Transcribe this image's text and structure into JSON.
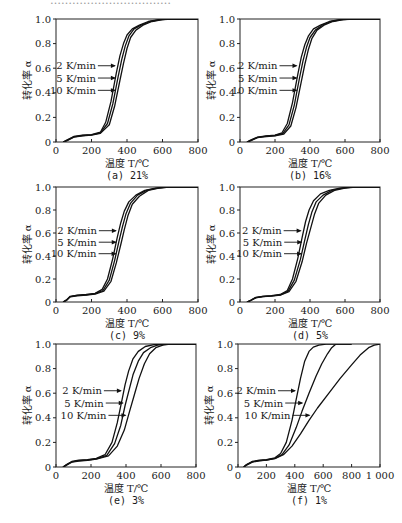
{
  "header_fragment": "……………………………",
  "chart_data": [
    {
      "id": "a",
      "type": "line",
      "caption": "(a) 21%",
      "xlabel": "温度 T/℃",
      "ylabel": "转化率 α",
      "xlim": [
        0,
        800
      ],
      "ylim": [
        0,
        1.0
      ],
      "xticks": [
        0,
        200,
        400,
        600,
        800
      ],
      "yticks": [
        0,
        0.2,
        0.4,
        0.6,
        0.8,
        1.0
      ],
      "ytick_labels": [
        "0",
        "0.2",
        "0.4",
        "0.6",
        "0.8",
        "1.0"
      ],
      "legend_arrows": [
        "2 K/min",
        "5 K/min",
        "10 K/min"
      ],
      "series": [
        {
          "name": "2 K/min",
          "x": [
            40,
            60,
            100,
            150,
            200,
            250,
            280,
            310,
            340,
            360,
            380,
            400,
            430,
            470,
            520,
            580,
            650,
            800
          ],
          "y": [
            0,
            0.015,
            0.045,
            0.055,
            0.06,
            0.08,
            0.16,
            0.33,
            0.56,
            0.7,
            0.8,
            0.87,
            0.92,
            0.95,
            0.98,
            0.995,
            1.0,
            1.0
          ]
        },
        {
          "name": "5 K/min",
          "x": [
            40,
            60,
            100,
            150,
            200,
            250,
            290,
            320,
            350,
            370,
            390,
            410,
            440,
            480,
            530,
            590,
            650,
            800
          ],
          "y": [
            0,
            0.012,
            0.042,
            0.053,
            0.058,
            0.075,
            0.15,
            0.31,
            0.53,
            0.67,
            0.78,
            0.86,
            0.92,
            0.95,
            0.98,
            0.995,
            1.0,
            1.0
          ]
        },
        {
          "name": "10 K/min",
          "x": [
            40,
            60,
            100,
            150,
            200,
            250,
            300,
            330,
            360,
            380,
            400,
            420,
            450,
            490,
            540,
            600,
            660,
            800
          ],
          "y": [
            0,
            0.01,
            0.04,
            0.05,
            0.055,
            0.07,
            0.14,
            0.29,
            0.5,
            0.64,
            0.76,
            0.85,
            0.91,
            0.95,
            0.98,
            0.995,
            1.0,
            1.0
          ]
        }
      ]
    },
    {
      "id": "b",
      "type": "line",
      "caption": "(b) 16%",
      "xlabel": "温度 T/℃",
      "ylabel": "转化率 α",
      "xlim": [
        0,
        800
      ],
      "ylim": [
        0,
        1.0
      ],
      "xticks": [
        0,
        200,
        400,
        600,
        800
      ],
      "yticks": [
        0,
        0.2,
        0.4,
        0.6,
        0.8,
        1.0
      ],
      "ytick_labels": [
        "0",
        "0.2",
        "0.4",
        "0.6",
        "0.8",
        "1.0"
      ],
      "legend_arrows": [
        "2 K/min",
        "5 K/min",
        "10 K/min"
      ],
      "series": [
        {
          "name": "2 K/min",
          "x": [
            40,
            60,
            100,
            150,
            200,
            240,
            270,
            300,
            330,
            350,
            370,
            390,
            420,
            460,
            510,
            570,
            650,
            800
          ],
          "y": [
            0,
            0.015,
            0.04,
            0.05,
            0.055,
            0.075,
            0.15,
            0.32,
            0.55,
            0.69,
            0.79,
            0.86,
            0.92,
            0.95,
            0.98,
            0.995,
            1.0,
            1.0
          ]
        },
        {
          "name": "5 K/min",
          "x": [
            40,
            60,
            100,
            150,
            200,
            245,
            280,
            310,
            340,
            360,
            380,
            400,
            430,
            470,
            520,
            580,
            650,
            800
          ],
          "y": [
            0,
            0.012,
            0.038,
            0.048,
            0.053,
            0.07,
            0.14,
            0.3,
            0.52,
            0.66,
            0.77,
            0.85,
            0.91,
            0.95,
            0.98,
            0.995,
            1.0,
            1.0
          ]
        },
        {
          "name": "10 K/min",
          "x": [
            40,
            60,
            100,
            150,
            200,
            250,
            290,
            320,
            350,
            370,
            390,
            410,
            440,
            480,
            530,
            590,
            660,
            800
          ],
          "y": [
            0,
            0.01,
            0.035,
            0.045,
            0.05,
            0.065,
            0.13,
            0.28,
            0.49,
            0.63,
            0.75,
            0.84,
            0.91,
            0.95,
            0.98,
            0.995,
            1.0,
            1.0
          ]
        }
      ]
    },
    {
      "id": "c",
      "type": "line",
      "caption": "(c) 9%",
      "xlabel": "温度 T/℃",
      "ylabel": "转化率 α",
      "xlim": [
        0,
        800
      ],
      "ylim": [
        0,
        1.0
      ],
      "xticks": [
        0,
        200,
        400,
        600,
        800
      ],
      "yticks": [
        0,
        0.2,
        0.4,
        0.6,
        0.8,
        1.0
      ],
      "ytick_labels": [
        "0",
        "0.2",
        "0.4",
        "0.6",
        "0.8",
        "1.0"
      ],
      "legend_arrows": [
        "2 K/min",
        "5 K/min",
        "10 K/min"
      ],
      "series": [
        {
          "name": "2 K/min",
          "x": [
            40,
            60,
            80,
            120,
            170,
            220,
            260,
            290,
            320,
            345,
            365,
            385,
            410,
            450,
            500,
            560,
            620,
            800
          ],
          "y": [
            0,
            0.02,
            0.05,
            0.06,
            0.065,
            0.075,
            0.11,
            0.2,
            0.38,
            0.56,
            0.69,
            0.79,
            0.87,
            0.93,
            0.97,
            0.99,
            1.0,
            1.0
          ]
        },
        {
          "name": "5 K/min",
          "x": [
            40,
            60,
            80,
            120,
            170,
            220,
            265,
            300,
            330,
            355,
            375,
            395,
            420,
            460,
            510,
            570,
            630,
            800
          ],
          "y": [
            0,
            0.018,
            0.047,
            0.057,
            0.062,
            0.072,
            0.1,
            0.19,
            0.36,
            0.53,
            0.66,
            0.77,
            0.86,
            0.93,
            0.97,
            0.99,
            1.0,
            1.0
          ]
        },
        {
          "name": "10 K/min",
          "x": [
            40,
            60,
            80,
            120,
            170,
            220,
            270,
            310,
            340,
            365,
            385,
            405,
            430,
            470,
            520,
            580,
            640,
            800
          ],
          "y": [
            0,
            0.015,
            0.044,
            0.054,
            0.059,
            0.069,
            0.095,
            0.18,
            0.34,
            0.5,
            0.63,
            0.75,
            0.85,
            0.92,
            0.97,
            0.99,
            1.0,
            1.0
          ]
        }
      ]
    },
    {
      "id": "d",
      "type": "line",
      "caption": "(d) 5%",
      "xlabel": "温度 T/℃",
      "ylabel": "转化率 α",
      "xlim": [
        0,
        800
      ],
      "ylim": [
        0,
        1.0
      ],
      "xticks": [
        0,
        200,
        400,
        600,
        800
      ],
      "yticks": [
        0,
        0.2,
        0.4,
        0.6,
        0.8,
        1.0
      ],
      "ytick_labels": [
        "0",
        "0.2",
        "0.4",
        "0.6",
        "0.8",
        "1.0"
      ],
      "legend_arrows": [
        "2 K/min",
        "5 K/min",
        "10 K/min"
      ],
      "series": [
        {
          "name": "2 K/min",
          "x": [
            40,
            60,
            90,
            130,
            180,
            230,
            270,
            300,
            330,
            355,
            375,
            395,
            420,
            460,
            510,
            570,
            630,
            800
          ],
          "y": [
            0,
            0.015,
            0.04,
            0.05,
            0.055,
            0.065,
            0.1,
            0.2,
            0.38,
            0.56,
            0.7,
            0.8,
            0.88,
            0.94,
            0.97,
            0.99,
            1.0,
            1.0
          ]
        },
        {
          "name": "5 K/min",
          "x": [
            40,
            60,
            90,
            130,
            180,
            230,
            275,
            310,
            345,
            370,
            390,
            410,
            435,
            475,
            525,
            585,
            645,
            800
          ],
          "y": [
            0,
            0.013,
            0.038,
            0.048,
            0.053,
            0.062,
            0.095,
            0.19,
            0.37,
            0.54,
            0.67,
            0.78,
            0.87,
            0.93,
            0.97,
            0.99,
            1.0,
            1.0
          ]
        },
        {
          "name": "10 K/min",
          "x": [
            40,
            60,
            90,
            130,
            180,
            230,
            280,
            320,
            355,
            380,
            405,
            425,
            450,
            490,
            540,
            600,
            660,
            800
          ],
          "y": [
            0,
            0.011,
            0.036,
            0.046,
            0.051,
            0.06,
            0.09,
            0.18,
            0.35,
            0.51,
            0.65,
            0.76,
            0.86,
            0.93,
            0.97,
            0.99,
            1.0,
            1.0
          ]
        }
      ]
    },
    {
      "id": "e",
      "type": "line",
      "caption": "(e) 3%",
      "xlabel": "温度 T/℃",
      "ylabel": "转化率 α",
      "xlim": [
        0,
        800
      ],
      "ylim": [
        0,
        1.0
      ],
      "xticks": [
        0,
        200,
        400,
        600,
        800
      ],
      "yticks": [
        0,
        0.2,
        0.4,
        0.6,
        0.8,
        1.0
      ],
      "ytick_labels": [
        "0",
        "0.2",
        "0.4",
        "0.6",
        "0.8",
        "1.0"
      ],
      "legend_arrows": [
        "2 K/min",
        "5 K/min",
        "10 K/min"
      ],
      "series": [
        {
          "name": "2 K/min",
          "x": [
            40,
            60,
            90,
            130,
            180,
            230,
            280,
            320,
            350,
            375,
            395,
            415,
            440,
            470,
            510,
            560,
            620,
            800
          ],
          "y": [
            0,
            0.02,
            0.045,
            0.055,
            0.06,
            0.07,
            0.1,
            0.2,
            0.36,
            0.53,
            0.67,
            0.78,
            0.88,
            0.94,
            0.98,
            0.995,
            1.0,
            1.0
          ]
        },
        {
          "name": "5 K/min",
          "x": [
            40,
            60,
            90,
            130,
            180,
            230,
            290,
            335,
            370,
            395,
            420,
            440,
            470,
            500,
            540,
            580,
            630,
            800
          ],
          "y": [
            0,
            0.017,
            0.042,
            0.052,
            0.057,
            0.067,
            0.095,
            0.19,
            0.34,
            0.5,
            0.64,
            0.75,
            0.86,
            0.93,
            0.97,
            0.99,
            1.0,
            1.0
          ]
        },
        {
          "name": "10 K/min",
          "x": [
            40,
            60,
            90,
            130,
            180,
            230,
            300,
            350,
            390,
            420,
            450,
            475,
            505,
            535,
            570,
            610,
            650,
            800
          ],
          "y": [
            0,
            0.014,
            0.039,
            0.049,
            0.054,
            0.064,
            0.09,
            0.17,
            0.3,
            0.45,
            0.6,
            0.72,
            0.84,
            0.92,
            0.97,
            0.99,
            1.0,
            1.0
          ]
        }
      ]
    },
    {
      "id": "f",
      "type": "line",
      "caption": "(f) 1%",
      "xlabel": "温度 T/℃",
      "ylabel": "转化率 α",
      "xlim": [
        0,
        1000
      ],
      "ylim": [
        0,
        1.0
      ],
      "xticks": [
        0,
        200,
        400,
        600,
        800,
        1000
      ],
      "xtick_labels": [
        "0",
        "200",
        "400",
        "600",
        "800",
        "1 000"
      ],
      "yticks": [
        0,
        0.2,
        0.4,
        0.6,
        0.8,
        1.0
      ],
      "ytick_labels": [
        "0",
        "0.2",
        "0.4",
        "0.6",
        "0.8",
        "1.0"
      ],
      "legend_arrows": [
        "2 K/min",
        "5 K/min",
        "10 K/min"
      ],
      "series": [
        {
          "name": "2 K/min",
          "x": [
            40,
            60,
            100,
            150,
            200,
            260,
            300,
            340,
            380,
            410,
            440,
            470,
            500,
            530,
            570,
            620,
            700,
            800
          ],
          "y": [
            0,
            0.02,
            0.045,
            0.055,
            0.06,
            0.075,
            0.11,
            0.2,
            0.38,
            0.55,
            0.72,
            0.86,
            0.94,
            0.975,
            0.99,
            1.0,
            1.0,
            1.0
          ]
        },
        {
          "name": "5 K/min",
          "x": [
            40,
            60,
            100,
            150,
            200,
            260,
            310,
            360,
            410,
            450,
            500,
            550,
            590,
            630,
            660,
            690,
            720,
            800
          ],
          "y": [
            0,
            0.018,
            0.042,
            0.052,
            0.057,
            0.07,
            0.1,
            0.18,
            0.32,
            0.45,
            0.6,
            0.74,
            0.84,
            0.92,
            0.97,
            1.0,
            1.0,
            1.0
          ]
        },
        {
          "name": "10 K/min",
          "x": [
            40,
            60,
            100,
            150,
            200,
            260,
            320,
            380,
            440,
            500,
            560,
            640,
            720,
            800,
            860,
            920,
            960,
            1050
          ],
          "y": [
            0,
            0.015,
            0.04,
            0.05,
            0.055,
            0.068,
            0.1,
            0.17,
            0.27,
            0.38,
            0.48,
            0.6,
            0.72,
            0.83,
            0.91,
            0.97,
            0.99,
            1.0
          ]
        }
      ]
    }
  ]
}
